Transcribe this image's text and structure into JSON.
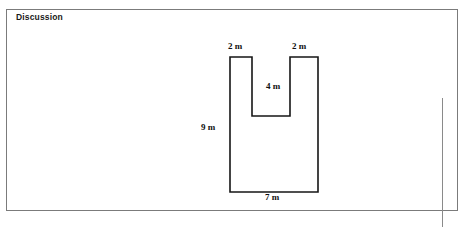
{
  "panel": {
    "title": "Discussion",
    "border_color": "#7b7b7b",
    "background": "#ffffff"
  },
  "figure": {
    "name": "u-shaped-polygon",
    "stroke_color": "#161616",
    "stroke_width": 1.6,
    "fill": "#ffffff",
    "labels": {
      "top_left": "2 m",
      "top_right": "2 m",
      "notch_depth": "4 m",
      "left_height": "9 m",
      "bottom_width": "7 m"
    },
    "dimensions": {
      "total_width_m": 7,
      "total_height_m": 9,
      "left_arm_width_m": 2,
      "right_arm_width_m": 2,
      "notch_width_m": 3,
      "notch_depth_m": 4,
      "unit": "m"
    }
  },
  "right_panel": {
    "border_color": "#8a8a8a"
  }
}
